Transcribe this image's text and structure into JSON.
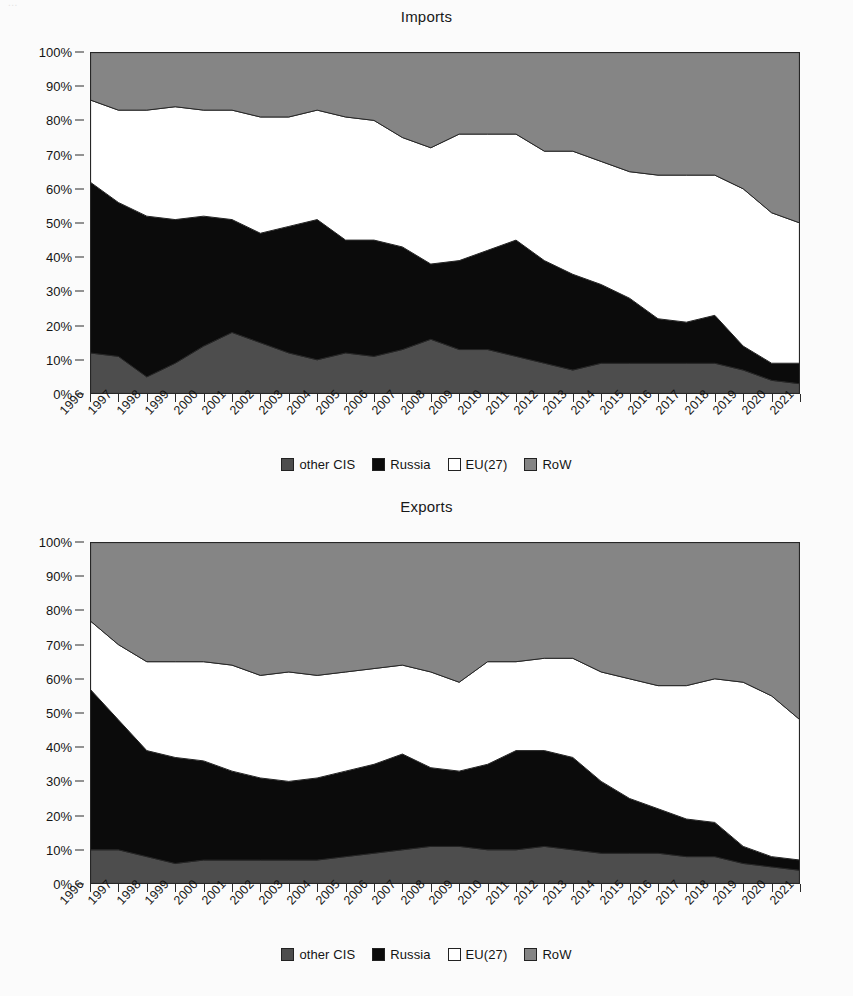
{
  "page": {
    "clipped_header_text": "..."
  },
  "legend": {
    "items": [
      {
        "label": "other CIS",
        "color": "#4d4d4d",
        "key": "other_cis"
      },
      {
        "label": "Russia",
        "color": "#0b0b0b",
        "key": "russia"
      },
      {
        "label": "EU(27)",
        "color": "#ffffff",
        "key": "eu27"
      },
      {
        "label": "RoW",
        "color": "#858585",
        "key": "row"
      }
    ]
  },
  "axis": {
    "y_ticks": [
      "0%",
      "10%",
      "20%",
      "30%",
      "40%",
      "50%",
      "60%",
      "70%",
      "80%",
      "90%",
      "100%"
    ],
    "y_values": [
      0,
      10,
      20,
      30,
      40,
      50,
      60,
      70,
      80,
      90,
      100
    ]
  },
  "chart_data": [
    {
      "type": "area",
      "title": "Imports",
      "xlabel": "",
      "ylabel": "",
      "ylim": [
        0,
        100
      ],
      "grid": false,
      "stacked": true,
      "legend_position": "bottom",
      "x": [
        1996,
        1997,
        1998,
        1999,
        2000,
        2001,
        2002,
        2003,
        2004,
        2005,
        2006,
        2007,
        2008,
        2009,
        2010,
        2011,
        2012,
        2013,
        2014,
        2015,
        2016,
        2017,
        2018,
        2019,
        2020,
        2021
      ],
      "categories": [
        "1996",
        "1997",
        "1998",
        "1999",
        "2000",
        "2001",
        "2002",
        "2003",
        "2004",
        "2005",
        "2006",
        "2007",
        "2008",
        "2009",
        "2010",
        "2011",
        "2012",
        "2013",
        "2014",
        "2015",
        "2016",
        "2017",
        "2018",
        "2019",
        "2020",
        "2021"
      ],
      "series": [
        {
          "name": "other CIS",
          "color": "#4d4d4d",
          "values": [
            12,
            11,
            5,
            9,
            14,
            18,
            15,
            12,
            10,
            12,
            11,
            13,
            16,
            13,
            13,
            11,
            9,
            7,
            9,
            9,
            9,
            9,
            9,
            7,
            4,
            3
          ]
        },
        {
          "name": "Russia",
          "color": "#0b0b0b",
          "values": [
            50,
            45,
            47,
            42,
            38,
            33,
            32,
            37,
            41,
            33,
            34,
            30,
            22,
            26,
            29,
            34,
            30,
            28,
            23,
            19,
            13,
            12,
            14,
            7,
            5,
            6
          ]
        },
        {
          "name": "EU(27)",
          "color": "#ffffff",
          "values": [
            24,
            27,
            31,
            33,
            31,
            32,
            34,
            32,
            32,
            36,
            35,
            32,
            34,
            37,
            34,
            31,
            32,
            36,
            36,
            37,
            42,
            43,
            41,
            46,
            44,
            41
          ]
        },
        {
          "name": "RoW",
          "color": "#858585",
          "values": [
            14,
            17,
            17,
            16,
            17,
            17,
            19,
            19,
            17,
            19,
            20,
            25,
            28,
            24,
            24,
            24,
            29,
            29,
            32,
            35,
            36,
            36,
            36,
            40,
            47,
            50
          ]
        }
      ]
    },
    {
      "type": "area",
      "title": "Exports",
      "xlabel": "",
      "ylabel": "",
      "ylim": [
        0,
        100
      ],
      "grid": false,
      "stacked": true,
      "legend_position": "bottom",
      "x": [
        1996,
        1997,
        1998,
        1999,
        2000,
        2001,
        2002,
        2003,
        2004,
        2005,
        2006,
        2007,
        2008,
        2009,
        2010,
        2011,
        2012,
        2013,
        2014,
        2015,
        2016,
        2017,
        2018,
        2019,
        2020,
        2021
      ],
      "categories": [
        "1996",
        "1997",
        "1998",
        "1999",
        "2000",
        "2001",
        "2002",
        "2003",
        "2004",
        "2005",
        "2006",
        "2007",
        "2008",
        "2009",
        "2010",
        "2011",
        "2012",
        "2013",
        "2014",
        "2015",
        "2016",
        "2017",
        "2018",
        "2019",
        "2020",
        "2021"
      ],
      "series": [
        {
          "name": "other CIS",
          "color": "#4d4d4d",
          "values": [
            10,
            10,
            8,
            6,
            7,
            7,
            7,
            7,
            7,
            8,
            9,
            10,
            11,
            11,
            10,
            10,
            11,
            10,
            9,
            9,
            9,
            8,
            8,
            6,
            5,
            4
          ]
        },
        {
          "name": "Russia",
          "color": "#0b0b0b",
          "values": [
            47,
            38,
            31,
            31,
            29,
            26,
            24,
            23,
            24,
            25,
            26,
            28,
            23,
            22,
            25,
            29,
            28,
            27,
            21,
            16,
            13,
            11,
            10,
            5,
            3,
            3
          ]
        },
        {
          "name": "EU(27)",
          "color": "#ffffff",
          "values": [
            20,
            22,
            26,
            28,
            29,
            31,
            30,
            32,
            30,
            29,
            28,
            26,
            28,
            26,
            30,
            26,
            27,
            29,
            32,
            35,
            36,
            39,
            42,
            48,
            47,
            41
          ]
        },
        {
          "name": "RoW",
          "color": "#858585",
          "values": [
            23,
            30,
            35,
            35,
            35,
            36,
            39,
            38,
            39,
            38,
            37,
            36,
            38,
            41,
            35,
            35,
            34,
            34,
            38,
            40,
            42,
            42,
            40,
            41,
            45,
            52
          ]
        }
      ]
    }
  ]
}
